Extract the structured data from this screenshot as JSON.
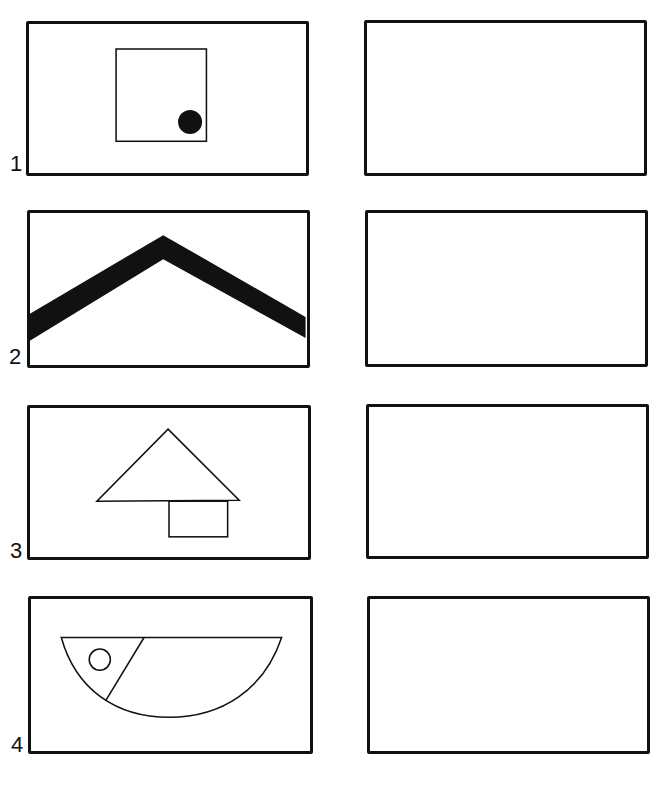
{
  "worksheet": {
    "rows": [
      {
        "number": "1",
        "model_figure": "small-square-with-black-dot-bottom-right",
        "copy_frame": "empty"
      },
      {
        "number": "2",
        "model_figure": "thick-black-chevron-roof-line",
        "copy_frame": "empty"
      },
      {
        "number": "3",
        "model_figure": "triangle-over-small-rectangle",
        "copy_frame": "empty"
      },
      {
        "number": "4",
        "model_figure": "half-circle-fish-with-eye",
        "copy_frame": "empty"
      }
    ]
  }
}
